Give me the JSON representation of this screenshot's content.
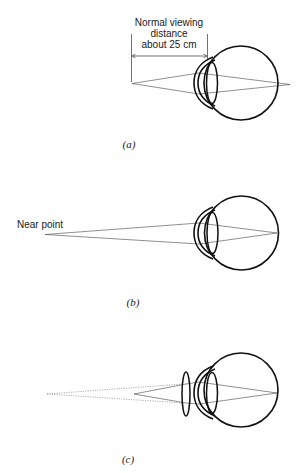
{
  "figure": {
    "panels": [
      {
        "id": "a",
        "label": "(a)",
        "annotation": {
          "lines": [
            "Normal viewing",
            "distance",
            "about 25 cm"
          ]
        },
        "description": "Normal eye viewing object at normal viewing distance"
      },
      {
        "id": "b",
        "label": "(b)",
        "annotation": {
          "text": "Near point"
        },
        "description": "Eye focusing on near point"
      },
      {
        "id": "c",
        "label": "(c)",
        "description": "Corrective lens placed in front of eye; dotted lines show virtual rays to near point"
      }
    ]
  }
}
